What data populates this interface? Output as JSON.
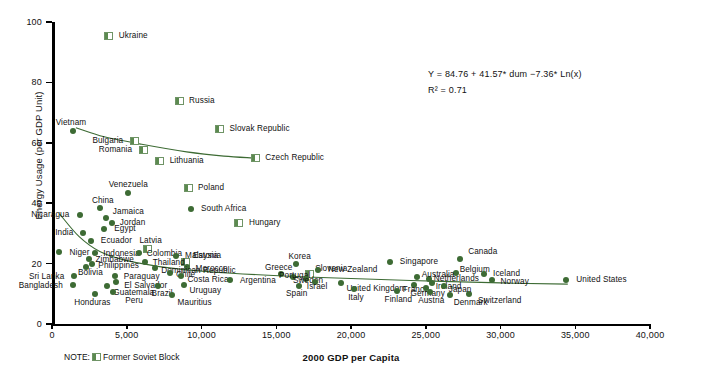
{
  "chart_data": {
    "type": "scatter",
    "title": "",
    "xlabel": "2000 GDP per Capita",
    "ylabel": "Energy Usage (per GDP Unit)",
    "xlim": [
      0,
      40000
    ],
    "ylim": [
      0,
      100
    ],
    "xticks": [
      "0",
      "5,000",
      "10,000",
      "15,000",
      "20,000",
      "25,000",
      "30,000",
      "35,000",
      "40,000"
    ],
    "xtick_values": [
      0,
      5000,
      10000,
      15000,
      20000,
      25000,
      30000,
      35000,
      40000
    ],
    "yticks": [
      "0",
      "20",
      "40",
      "60",
      "80",
      "100"
    ],
    "ytick_values": [
      0,
      20,
      40,
      60,
      80,
      100
    ],
    "grid": false,
    "legend": "none",
    "annotations": {
      "equation": "Y = 84.76 + 41.57* dum −7.36* Ln(x)",
      "r_squared": "R² = 0.71",
      "note_prefix": "NOTE:",
      "note_text": "Former Soviet Block"
    },
    "series": [
      {
        "name": "Former Soviet Block",
        "marker": "half-filled-square",
        "points": [
          {
            "label": "Ukraine",
            "x": 3800,
            "y": 95.5,
            "lx": 10,
            "ly": -4
          },
          {
            "label": "Russia",
            "x": 8500,
            "y": 74.0,
            "lx": 10,
            "ly": -4
          },
          {
            "label": "Slovak Republic",
            "x": 11200,
            "y": 64.5,
            "lx": 10,
            "ly": -4
          },
          {
            "label": "Czech Republic",
            "x": 13600,
            "y": 55.0,
            "lx": 10,
            "ly": -4
          },
          {
            "label": "Bulgaria",
            "x": 5500,
            "y": 60.5,
            "lx": -11,
            "ly": -4,
            "align": "r"
          },
          {
            "label": "Romania",
            "x": 6100,
            "y": 57.5,
            "lx": -11,
            "ly": -4,
            "align": "r"
          },
          {
            "label": "Lithuania",
            "x": 7200,
            "y": 54.0,
            "lx": 10,
            "ly": -4
          },
          {
            "label": "Poland",
            "x": 9100,
            "y": 45.0,
            "lx": 10,
            "ly": -4
          },
          {
            "label": "Hungary",
            "x": 12500,
            "y": 33.5,
            "lx": 10,
            "ly": -4
          },
          {
            "label": "Estonia",
            "x": 8900,
            "y": 20.5,
            "lx": 8,
            "ly": -10
          },
          {
            "label": "Latvia",
            "x": 6400,
            "y": 25.0,
            "lx": 3,
            "ly": -12,
            "align": "c"
          },
          {
            "label": "Slovenia",
            "x": 17200,
            "y": 16.5,
            "lx": 6,
            "ly": -9
          }
        ]
      },
      {
        "name": "Other Countries",
        "marker": "filled-circle",
        "points": [
          {
            "label": "Vietnam",
            "x": 1400,
            "y": 64.0,
            "lx": -2,
            "ly": -12,
            "align": "c"
          },
          {
            "label": "Venezuela",
            "x": 5100,
            "y": 43.5,
            "lx": 0,
            "ly": -12,
            "align": "c"
          },
          {
            "label": "South Africa",
            "x": 9300,
            "y": 38.0,
            "lx": 10,
            "ly": -4
          },
          {
            "label": "Nicaragua",
            "x": 1900,
            "y": 36.0,
            "lx": -11,
            "ly": -4,
            "align": "r"
          },
          {
            "label": "China",
            "x": 3200,
            "y": 38.5,
            "lx": 3,
            "ly": -11,
            "align": "c"
          },
          {
            "label": "Jamaica",
            "x": 3600,
            "y": 35.0,
            "lx": 7,
            "ly": -10
          },
          {
            "label": "Jordan",
            "x": 4000,
            "y": 33.5,
            "lx": 8,
            "ly": -4
          },
          {
            "label": "India",
            "x": 2100,
            "y": 30.0,
            "lx": -10,
            "ly": -4,
            "align": "r"
          },
          {
            "label": "Egypt",
            "x": 3500,
            "y": 31.5,
            "lx": 10,
            "ly": -4
          },
          {
            "label": "Ecuador",
            "x": 2600,
            "y": 27.5,
            "lx": 10,
            "ly": -4
          },
          {
            "label": "Niger",
            "x": 500,
            "y": 24.0,
            "lx": 10,
            "ly": -3
          },
          {
            "label": "Indonesia",
            "x": 2900,
            "y": 23.5,
            "lx": 8,
            "ly": -3
          },
          {
            "label": "Colombia",
            "x": 5800,
            "y": 23.5,
            "lx": 8,
            "ly": -3
          },
          {
            "label": "Malaysia",
            "x": 8300,
            "y": 22.5,
            "lx": 9,
            "ly": -4
          },
          {
            "label": "Zimbabwe",
            "x": 2500,
            "y": 21.5,
            "lx": 6,
            "ly": -3
          },
          {
            "label": "Philippines",
            "x": 2700,
            "y": 20.0,
            "lx": 6,
            "ly": -2
          },
          {
            "label": "Thailand",
            "x": 6200,
            "y": 20.5,
            "lx": 8,
            "ly": -3
          },
          {
            "label": "Morocco",
            "x": 9000,
            "y": 19.0,
            "lx": 9,
            "ly": -2
          },
          {
            "label": "Bolivia",
            "x": 2300,
            "y": 19.0,
            "lx": 4,
            "ly": 2,
            "align": "c"
          },
          {
            "label": "Dominican Republic",
            "x": 6900,
            "y": 18.5,
            "lx": 6,
            "ly": -1
          },
          {
            "label": "Sri Lanka",
            "x": 1500,
            "y": 16.0,
            "lx": -10,
            "ly": -3,
            "align": "r"
          },
          {
            "label": "Paraguay",
            "x": 4200,
            "y": 16.0,
            "lx": 9,
            "ly": -3
          },
          {
            "label": "Chile",
            "x": 7900,
            "y": 17.0,
            "lx": 6,
            "ly": -2
          },
          {
            "label": "Costa Rica",
            "x": 8600,
            "y": 16.0,
            "lx": 7,
            "ly": 0
          },
          {
            "label": "Bangladesh",
            "x": 1400,
            "y": 13.0,
            "lx": -10,
            "ly": -3,
            "align": "r"
          },
          {
            "label": "El Salvador",
            "x": 4300,
            "y": 14.0,
            "lx": 8,
            "ly": 0
          },
          {
            "label": "Guatemala",
            "x": 3700,
            "y": 12.5,
            "lx": 6,
            "ly": 3
          },
          {
            "label": "Uruguay",
            "x": 8800,
            "y": 13.0,
            "lx": 6,
            "ly": 2
          },
          {
            "label": "Brazil",
            "x": 7100,
            "y": 12.5,
            "lx": 4,
            "ly": 4,
            "align": "c"
          },
          {
            "label": "Honduras",
            "x": 2900,
            "y": 10.0,
            "lx": -3,
            "ly": 5,
            "align": "c"
          },
          {
            "label": "Peru",
            "x": 4100,
            "y": 10.5,
            "lx": 12,
            "ly": 5
          },
          {
            "label": "Mauritius",
            "x": 8000,
            "y": 9.5,
            "lx": 6,
            "ly": 4
          },
          {
            "label": "Argentina",
            "x": 11900,
            "y": 14.5,
            "lx": 10,
            "ly": -3
          },
          {
            "label": "Korea",
            "x": 16300,
            "y": 20.0,
            "lx": 4,
            "ly": -11,
            "align": "c"
          },
          {
            "label": "Greece",
            "x": 15300,
            "y": 16.5,
            "lx": -2,
            "ly": -10,
            "align": "c"
          },
          {
            "label": "Portugal",
            "x": 16100,
            "y": 15.5,
            "lx": 2,
            "ly": -5,
            "align": "c"
          },
          {
            "label": "Sweden",
            "x": 17000,
            "y": 15.0,
            "lx": 2,
            "ly": -2,
            "align": "c"
          },
          {
            "label": "Israel",
            "x": 17600,
            "y": 14.0,
            "lx": 2,
            "ly": 1,
            "align": "c"
          },
          {
            "label": "Spain",
            "x": 16500,
            "y": 12.5,
            "lx": -2,
            "ly": 4,
            "align": "c"
          },
          {
            "label": "New Zealand",
            "x": 17800,
            "y": 18.0,
            "lx": 10,
            "ly": -4
          },
          {
            "label": "United Kingdom",
            "x": 19300,
            "y": 13.5,
            "lx": 6,
            "ly": 2
          },
          {
            "label": "Italy",
            "x": 20200,
            "y": 11.5,
            "lx": 2,
            "ly": 5,
            "align": "c"
          },
          {
            "label": "Singapore",
            "x": 22600,
            "y": 20.5,
            "lx": 10,
            "ly": -4
          },
          {
            "label": "Finland",
            "x": 23100,
            "y": 11.0,
            "lx": 1,
            "ly": 5,
            "align": "c"
          },
          {
            "label": "Switzerland",
            "x": 27900,
            "y": 10.0,
            "lx": 9,
            "ly": 3
          },
          {
            "label": "Canada",
            "x": 27300,
            "y": 21.5,
            "lx": 8,
            "ly": -11
          },
          {
            "label": "Belgium",
            "x": 27000,
            "y": 17.0,
            "lx": 4,
            "ly": -7
          },
          {
            "label": "Iceland",
            "x": 28900,
            "y": 16.5,
            "lx": 9,
            "ly": -4
          },
          {
            "label": "Norway",
            "x": 29400,
            "y": 14.5,
            "lx": 9,
            "ly": -2
          },
          {
            "label": "Netherlands",
            "x": 25200,
            "y": 15.0,
            "lx": 5,
            "ly": -4
          },
          {
            "label": "Australia",
            "x": 24400,
            "y": 15.5,
            "lx": 5,
            "ly": -6
          },
          {
            "label": "Ireland",
            "x": 25400,
            "y": 13.5,
            "lx": 4,
            "ly": 0
          },
          {
            "label": "France",
            "x": 24200,
            "y": 13.0,
            "lx": 2,
            "ly": 1,
            "align": "c"
          },
          {
            "label": "Germany",
            "x": 25000,
            "y": 12.0,
            "lx": 2,
            "ly": 2,
            "align": "c"
          },
          {
            "label": "Japan",
            "x": 26200,
            "y": 12.5,
            "lx": 5,
            "ly": 0
          },
          {
            "label": "Austria",
            "x": 25300,
            "y": 10.5,
            "lx": 1,
            "ly": 5,
            "align": "c"
          },
          {
            "label": "Denmark",
            "x": 26600,
            "y": 9.5,
            "lx": 4,
            "ly": 4
          },
          {
            "label": "United States",
            "x": 34400,
            "y": 14.5,
            "lx": 10,
            "ly": -4
          }
        ]
      }
    ],
    "trend_lines": [
      {
        "name": "soviet-trend",
        "points": [
          [
            1600,
            65.0
          ],
          [
            3500,
            62.0
          ],
          [
            6000,
            59.5
          ],
          [
            9000,
            57.0
          ],
          [
            11500,
            55.6
          ],
          [
            13400,
            55.0
          ]
        ]
      },
      {
        "name": "other-trend",
        "points": [
          [
            500,
            36.5
          ],
          [
            1800,
            29.0
          ],
          [
            3200,
            24.0
          ],
          [
            5000,
            21.0
          ],
          [
            8000,
            18.5
          ],
          [
            12000,
            16.8
          ],
          [
            18000,
            15.4
          ],
          [
            24000,
            14.4
          ],
          [
            30000,
            13.6
          ],
          [
            34500,
            13.2
          ]
        ]
      }
    ]
  },
  "colors": {
    "marker": "#3d6b34",
    "soviet_fill": "#5c8a50",
    "soviet_border": "#6f9466",
    "trend": "#3d6b34",
    "axis": "#000000",
    "text": "#111111"
  }
}
